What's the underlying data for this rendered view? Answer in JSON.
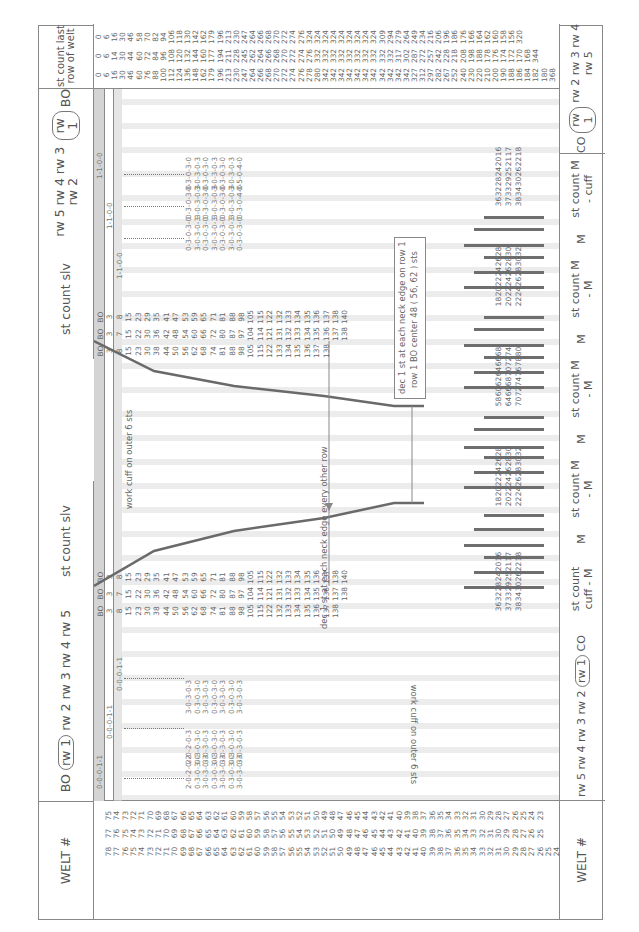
{
  "header": {
    "welt_label": "WELT #",
    "left_rows_label": "BO rw 1 rw 2 rw 3 rw 4 rw 5",
    "left_rows_parts": [
      "BO",
      "rw 1",
      "rw 2 rw 3 rw 4 rw 5"
    ],
    "left_sleeve_label": "st count slv",
    "right_sleeve_label": "st count slv",
    "right_rows_parts": [
      "rw 5 rw 4 rw 3 rw 2",
      "rw 1",
      "BO"
    ],
    "last_row_label": "st count last row of welt"
  },
  "footer": {
    "welt_label": "WELT #",
    "left_rows_parts": [
      "rw 5 rw 4 rw 3 rw 2",
      "rw 1",
      "CO"
    ],
    "segments": [
      {
        "label": "st count cuff - M"
      },
      {
        "label": "M"
      },
      {
        "label": "st count M - M"
      },
      {
        "label": "M"
      },
      {
        "label": "st count M - M"
      },
      {
        "label": "M"
      },
      {
        "label": "st count M - M"
      },
      {
        "label": "M"
      },
      {
        "label": "st count M - cuff"
      }
    ],
    "right_rows_parts": [
      "CO",
      "rw 1",
      "rw 2 rw 3 rw 4 rw 5"
    ]
  },
  "welt_numbers": {
    "col1": [
      78,
      77,
      76,
      75,
      74,
      73,
      72,
      71,
      70,
      69,
      68,
      67,
      66,
      65,
      64,
      63,
      62,
      61,
      60,
      59,
      58,
      57,
      56,
      55,
      54,
      53,
      52,
      51,
      50,
      49,
      48,
      47,
      46,
      45,
      44,
      43,
      42,
      41,
      40,
      39,
      38,
      37,
      36,
      35,
      34,
      33,
      32,
      31,
      30,
      29,
      28,
      27,
      26,
      25,
      24
    ],
    "col2": [
      77,
      76,
      75,
      74,
      73,
      72,
      71,
      70,
      69,
      68,
      67,
      66,
      65,
      64,
      63,
      62,
      61,
      60,
      59,
      58,
      57,
      56,
      55,
      54,
      53,
      52,
      51,
      50,
      49,
      48,
      47,
      46,
      45,
      44,
      43,
      42,
      41,
      40,
      39,
      38,
      37,
      36,
      35,
      34,
      33,
      32,
      31,
      30,
      29,
      28,
      27,
      26,
      25
    ],
    "col3": [
      75,
      74,
      73,
      72,
      71,
      70,
      69,
      68,
      67,
      66,
      65,
      64,
      63,
      62,
      61,
      60,
      59,
      58,
      57,
      56,
      55,
      54,
      53,
      52,
      51,
      50,
      49,
      48,
      47,
      46,
      45,
      44,
      43,
      42,
      41,
      40,
      39,
      38,
      37,
      36,
      35,
      34,
      33,
      32,
      31,
      30,
      29,
      28,
      27,
      26,
      25,
      24,
      23
    ]
  },
  "left_sleeve_counts": {
    "col_a": [
      "BO",
      "3",
      "8",
      "15",
      "23",
      "30",
      "38",
      "44",
      "50",
      "56",
      "62",
      "68",
      "74",
      "81",
      "88",
      "98",
      "105",
      "115",
      "122",
      "132",
      "133",
      "134",
      "135",
      "136",
      "137",
      "138"
    ],
    "col_b": [
      "BO",
      "3",
      "7",
      "15",
      "22",
      "30",
      "36",
      "42",
      "48",
      "54",
      "60",
      "66",
      "72",
      "80",
      "87",
      "97",
      "104",
      "114",
      "121",
      "131",
      "132",
      "133",
      "134",
      "135",
      "136",
      "137",
      "138"
    ],
    "col_c": [
      "BO",
      "3",
      "8",
      "15",
      "23",
      "29",
      "35",
      "41",
      "47",
      "53",
      "59",
      "65",
      "71",
      "81",
      "88",
      "98",
      "105",
      "115",
      "122",
      "132",
      "133",
      "134",
      "135",
      "136",
      "137",
      "138",
      "140"
    ]
  },
  "right_sleeve_counts": {
    "col_a": [
      "BO",
      "3",
      "8",
      "15",
      "23",
      "30",
      "38",
      "44",
      "50",
      "56",
      "62",
      "68",
      "74",
      "81",
      "88",
      "98",
      "105",
      "115",
      "122",
      "133",
      "134",
      "135",
      "136",
      "137",
      "138"
    ],
    "col_b": [
      "BO",
      "3",
      "7",
      "15",
      "22",
      "30",
      "36",
      "42",
      "48",
      "54",
      "60",
      "66",
      "72",
      "80",
      "87",
      "97",
      "104",
      "114",
      "121",
      "131",
      "132",
      "133",
      "134",
      "135",
      "136",
      "137",
      "138"
    ],
    "col_c": [
      "BO",
      "3",
      "8",
      "15",
      "23",
      "29",
      "35",
      "41",
      "47",
      "53",
      "59",
      "65",
      "71",
      "81",
      "88",
      "98",
      "105",
      "115",
      "122",
      "132",
      "133",
      "134",
      "135",
      "136",
      "137",
      "138",
      "140"
    ]
  },
  "last_row_counts": {
    "col_a": [
      "0",
      "6",
      "16",
      "30",
      "46",
      "60",
      "76",
      "88",
      "100",
      "112",
      "124",
      "136",
      "148",
      "162",
      "179",
      "196",
      "213",
      "230",
      "247",
      "264",
      "266",
      "268",
      "270",
      "272",
      "274",
      "276",
      "278",
      "280",
      "342",
      "342",
      "342",
      "342",
      "342",
      "342",
      "342",
      "342",
      "342",
      "342",
      "342",
      "327",
      "312",
      "297",
      "282",
      "267",
      "252",
      "240",
      "230",
      "220",
      "210",
      "200",
      "190",
      "188",
      "186",
      "184",
      "182",
      "180",
      "368"
    ],
    "col_b": [
      "0",
      "6",
      "14",
      "30",
      "44",
      "60",
      "72",
      "84",
      "96",
      "108",
      "120",
      "132",
      "144",
      "160",
      "177",
      "194",
      "211",
      "228",
      "245",
      "262",
      "264",
      "266",
      "268",
      "270",
      "272",
      "274",
      "276",
      "332",
      "332",
      "332",
      "332",
      "332",
      "332",
      "332",
      "332",
      "332",
      "332",
      "317",
      "302",
      "287",
      "272",
      "257",
      "242",
      "228",
      "218",
      "208",
      "198",
      "188",
      "178",
      "176",
      "174",
      "172",
      "170",
      "168",
      "344"
    ],
    "col_c": [
      "0",
      "6",
      "16",
      "30",
      "46",
      "58",
      "70",
      "82",
      "94",
      "106",
      "118",
      "130",
      "142",
      "162",
      "179",
      "196",
      "213",
      "230",
      "247",
      "264",
      "266",
      "268",
      "270",
      "272",
      "274",
      "276",
      "324",
      "324",
      "324",
      "324",
      "324",
      "324",
      "324",
      "324",
      "324",
      "309",
      "294",
      "279",
      "264",
      "249",
      "234",
      "216",
      "206",
      "196",
      "186",
      "176",
      "166",
      "164",
      "162",
      "160",
      "158",
      "156",
      "320"
    ]
  },
  "instructions": {
    "top_row5": "0-0-0-1-1",
    "top_row4": "0-0-0-1-1",
    "top_row3": "0-0-0-1-1",
    "top_block_a": [
      "2-0-2-0-2",
      "0-3-0-3-0",
      "3-0-3-0-3",
      "0-3-0-3-0",
      "3-0-3-0-3",
      "0-3-0-3-0",
      "3-0-3-0-3"
    ],
    "top_block_b": [
      "2-0-2-0-3",
      "0-3-0-3-0",
      "3-0-3-0-3",
      "0-3-0-3-0",
      "3-0-3-0-3",
      "0-3-0-3-0",
      "3-0-3-0-3"
    ],
    "top_block_c": [
      "3-0-3-0-3",
      "0-3-0-3-0",
      "3-0-3-0-3",
      "0-3-0-3-0",
      "3-0-3-0-3",
      "0-3-0-3-0",
      "3-0-3-0-3"
    ],
    "top_right_a": [
      "0-3-0-3-0",
      "3-0-3-0-3",
      "0-3-0-3-0",
      "3-0-3-0-3",
      "0-3-0-3-0",
      "3-0-3-0-3",
      "0-5-0-4-0"
    ],
    "top_right_b": [
      "0-3-0-3-0",
      "3-0-3-0-3",
      "0-3-0-3-0",
      "3-0-3-0-3",
      "0-3-0-3-0",
      "3-0-3-0-3",
      "0-3-0-4-0"
    ],
    "top_right_c": [
      "0-3-0-3-0",
      "3-0-3-0-3",
      "0-3-0-3-0",
      "3-0-3-0-3",
      "0-3-0-3-0",
      "3-0-3-0-3",
      "0-3-0-3-0"
    ],
    "bottom_row5": "1-1-0-0-0",
    "bottom_row4": "1-1-0-0-0",
    "bottom_row3": "1-1-0-0-0",
    "bottom_block_a": [
      "0-4-0-5-0",
      "3-0-3-0-3",
      "0-3-0-3-0",
      "3-0-3-0-3",
      "0-3-0-3-0",
      "3-0-3-0-3",
      "0-3-0-3-0"
    ],
    "bottom_block_b": [
      "0-4-0-3-0",
      "3-0-3-0-3",
      "0-3-0-3-0",
      "3-0-3-0-3",
      "0-3-0-3-0",
      "3-0-3-0-3",
      "0-3-0-3-0"
    ],
    "bottom_block_c": [
      "0-3-0-3-0",
      "3-0-3-0-3",
      "0-3-0-3-0",
      "3-0-3-0-3",
      "0-3-0-3-0",
      "3-0-3-0-3",
      "0-3-0-3-0"
    ],
    "bottom_right_a": [
      "3-0-3-0-3",
      "0-3-0-3-0",
      "3-0-3-0-3",
      "0-3-0-3-0",
      "3-0-3-0-3",
      "0-3-0-3-0",
      "2-0-2-0-2"
    ],
    "bottom_right_b": [
      "3-0-3-0-3",
      "0-3-0-3-0",
      "3-0-3-0-3",
      "0-3-0-3-0",
      "3-0-3-0-3",
      "0-3-0-2-0",
      "2-0-2-0-2"
    ],
    "bottom_right_c": [
      "3-0-3-0-3",
      "0-3-0-3-0",
      "3-0-3-0-3",
      "0-3-0-3-0",
      "3-0-3-0-3",
      "0-3-0-3-0",
      "3-0-3-0-3"
    ],
    "co_left_row5": "0-0-1-1",
    "co_left_row4": "0-0-1-1",
    "co_left_row3": "0-0-1-1",
    "co_right_row5": "1-1-0-0",
    "co_right_row4": "1-1-0-0",
    "co_right_row3": "1-1-0-0"
  },
  "notes": {
    "work_cuff_top": "work cuff on outer 6 sts",
    "work_cuff_bottom": "work cuff on outer 6 sts",
    "dec_every_other": "dec 1 st at each neck edge every other row",
    "dec_row1_line1": "dec 1 st at each neck edge on row 1",
    "dec_row1_line2": "row 1 BO center  48 ( 56, 62 ) sts"
  },
  "bottom_counts": {
    "cuff_m": [
      [
        "36",
        "32",
        "28",
        "24",
        "20",
        "16"
      ],
      [
        "37",
        "33",
        "29",
        "25",
        "21",
        "17"
      ],
      [
        "38",
        "34",
        "30",
        "26",
        "22",
        "18"
      ]
    ],
    "m_m_1": [
      [
        "18",
        "20",
        "22",
        "24",
        "26",
        "28"
      ],
      [
        "20",
        "22",
        "24",
        "26",
        "28",
        "30"
      ],
      [
        "22",
        "24",
        "26",
        "28",
        "30",
        "32"
      ]
    ],
    "m_m_2": [
      [
        "58",
        "60",
        "62",
        "64",
        "66",
        "68"
      ],
      [
        "64",
        "66",
        "68",
        "70",
        "72",
        "74"
      ],
      [
        "70",
        "72",
        "74",
        "76",
        "78",
        "80"
      ]
    ],
    "m_m_3": [
      [
        "18",
        "20",
        "22",
        "24",
        "26",
        "28"
      ],
      [
        "20",
        "22",
        "24",
        "26",
        "28",
        "30"
      ],
      [
        "22",
        "24",
        "26",
        "28",
        "30",
        "32"
      ]
    ],
    "m_cuff": [
      [
        "36",
        "32",
        "28",
        "24",
        "20",
        "16"
      ],
      [
        "37",
        "33",
        "29",
        "25",
        "21",
        "17"
      ],
      [
        "38",
        "34",
        "30",
        "26",
        "22",
        "18"
      ]
    ]
  },
  "colors": {
    "line": "#888888",
    "text": "#555555",
    "stripe": "#e6e6e6",
    "shade": "#d4d4d4",
    "bars": "#6e6e6e"
  }
}
